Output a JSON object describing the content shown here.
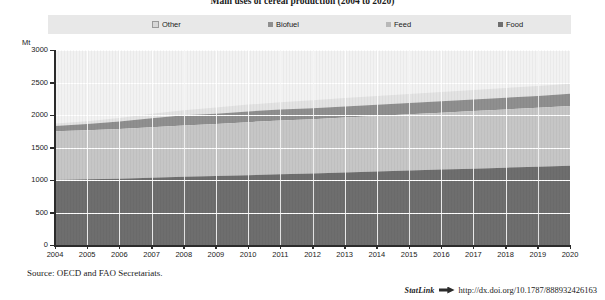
{
  "figure": {
    "title": "Main uses of cereal production (2004 to 2020)",
    "source_note": "Source:  OECD and FAO Secretariats.",
    "statlink_word": "StatLink",
    "statlink_url": "http://dx.doi.org/10.1787/888932426163"
  },
  "legend": {
    "items": [
      {
        "label": "Other",
        "color": "#e3e3e3"
      },
      {
        "label": "Biofuel",
        "color": "#8f8f8f"
      },
      {
        "label": "Feed",
        "color": "#c6c6c6"
      },
      {
        "label": "Food",
        "color": "#6e6e6e"
      }
    ]
  },
  "axes": {
    "y_unit": "Mt",
    "y_ticks": [
      "3000",
      "2500",
      "2000",
      "1500",
      "1000",
      "500",
      "0"
    ],
    "x_ticks": [
      "2004",
      "2005",
      "2006",
      "2007",
      "2008",
      "2009",
      "2010",
      "2011",
      "2012",
      "2013",
      "2014",
      "2015",
      "2016",
      "2017",
      "2018",
      "2019",
      "2020"
    ]
  },
  "chart_data": {
    "type": "area",
    "title": "Main uses of cereal production (2004 to 2020)",
    "xlabel": "",
    "ylabel": "Mt",
    "ylim": [
      0,
      3000
    ],
    "ytick_step": 500,
    "grid": true,
    "stacked": true,
    "legend_position": "top",
    "x": [
      2004,
      2005,
      2006,
      2007,
      2008,
      2009,
      2010,
      2011,
      2012,
      2013,
      2014,
      2015,
      2016,
      2017,
      2018,
      2019,
      2020
    ],
    "series": [
      {
        "name": "Food",
        "color": "#6e6e6e",
        "values": [
          1000,
          1010,
          1020,
          1035,
          1050,
          1060,
          1075,
          1090,
          1100,
          1115,
          1130,
          1145,
          1160,
          1175,
          1190,
          1205,
          1220
        ]
      },
      {
        "name": "Feed",
        "color": "#c6c6c6",
        "values": [
          750,
          755,
          765,
          775,
          790,
          800,
          815,
          825,
          835,
          845,
          855,
          865,
          875,
          885,
          895,
          905,
          920
        ]
      },
      {
        "name": "Biofuel",
        "color": "#8f8f8f",
        "values": [
          80,
          95,
          115,
          140,
          155,
          160,
          165,
          168,
          170,
          172,
          174,
          176,
          178,
          180,
          182,
          184,
          186
        ]
      },
      {
        "name": "Other",
        "color": "#e3e3e3",
        "values": [
          40,
          45,
          55,
          70,
          80,
          95,
          105,
          115,
          122,
          128,
          132,
          136,
          140,
          144,
          148,
          152,
          156
        ]
      }
    ],
    "cumulative_totals": [
      1870,
      1905,
      1955,
      2020,
      2075,
      2115,
      2160,
      2198,
      2227,
      2260,
      2291,
      2322,
      2353,
      2384,
      2415,
      2446,
      2482
    ]
  }
}
